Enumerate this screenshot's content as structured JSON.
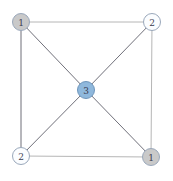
{
  "figure": {
    "width": 173,
    "height": 181,
    "background": "#ffffff",
    "type": "node-link-graph"
  },
  "chart_data": {
    "type": "diagram",
    "subtype": "node-link-graph",
    "title": "",
    "layout": "square-with-center",
    "node_radius": 8.5,
    "nodes": [
      {
        "id": "top-left",
        "label": "1",
        "x": 21,
        "y": 22,
        "fill": "#c9c9c9",
        "stroke": "#9aa8bb"
      },
      {
        "id": "top-right",
        "label": "2",
        "x": 152,
        "y": 22,
        "fill": "#fbfdff",
        "stroke": "#9aa8bb"
      },
      {
        "id": "center",
        "label": "3",
        "x": 86,
        "y": 90,
        "fill": "#8fb8dc",
        "stroke": "#6e95bb"
      },
      {
        "id": "bottom-left",
        "label": "2",
        "x": 21,
        "y": 156,
        "fill": "#fbfdff",
        "stroke": "#9aa8bb"
      },
      {
        "id": "bottom-right",
        "label": "1",
        "x": 151,
        "y": 157,
        "fill": "#c9c9c9",
        "stroke": "#9aa8bb"
      }
    ],
    "edges": [
      {
        "id": "edge-top",
        "source": "top-left",
        "target": "top-right",
        "color": "#b6b6b6",
        "width": 1
      },
      {
        "id": "edge-left",
        "source": "top-left",
        "target": "bottom-left",
        "color": "#6f6f78",
        "width": 1
      },
      {
        "id": "edge-right",
        "source": "top-right",
        "target": "bottom-right",
        "color": "#b6b6b6",
        "width": 1
      },
      {
        "id": "edge-bottom",
        "source": "bottom-left",
        "target": "bottom-right",
        "color": "#b6b6b6",
        "width": 1
      },
      {
        "id": "edge-tl-center",
        "source": "top-left",
        "target": "center",
        "color": "#70707a",
        "width": 1
      },
      {
        "id": "edge-tr-center",
        "source": "top-right",
        "target": "center",
        "color": "#70707a",
        "width": 1
      },
      {
        "id": "edge-bl-center",
        "source": "bottom-left",
        "target": "center",
        "color": "#70707a",
        "width": 1
      },
      {
        "id": "edge-br-center",
        "source": "bottom-right",
        "target": "center",
        "color": "#70707a",
        "width": 1
      }
    ],
    "node_count": 5,
    "edge_count": 8,
    "labels": [
      "1",
      "2",
      "3",
      "2",
      "1"
    ]
  }
}
